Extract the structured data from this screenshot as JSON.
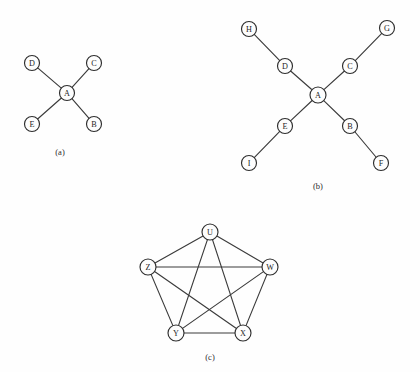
{
  "figure": {
    "background_color": "#fefefe",
    "edge_color": "#3b3b3b",
    "node_fill_color": "#fdfdfd",
    "node_stroke_color": "#2e2e2e",
    "label_color": "#1d1d1d",
    "node_radius": 7.5,
    "panels": [
      {
        "id": "a",
        "caption": "(a)",
        "caption_x": 60,
        "caption_y": 152,
        "description": "star graph with center A and four leaves",
        "nodes": [
          {
            "id": "A",
            "label": "A",
            "x": 67,
            "y": 93,
            "r": 7.5
          },
          {
            "id": "B",
            "label": "B",
            "x": 94,
            "y": 124,
            "r": 7.5
          },
          {
            "id": "C",
            "label": "C",
            "x": 94,
            "y": 63,
            "r": 7.5
          },
          {
            "id": "D",
            "label": "D",
            "x": 32,
            "y": 63,
            "r": 7.5
          },
          {
            "id": "E",
            "label": "E",
            "x": 32,
            "y": 124,
            "r": 7.5
          }
        ],
        "edges": [
          {
            "from": "A",
            "to": "B"
          },
          {
            "from": "A",
            "to": "C"
          },
          {
            "from": "A",
            "to": "D"
          },
          {
            "from": "A",
            "to": "E"
          }
        ]
      },
      {
        "id": "b",
        "caption": "(b)",
        "caption_x": 318,
        "caption_y": 186,
        "description": "tree with center A, four branches each extending to a leaf",
        "nodes": [
          {
            "id": "A",
            "label": "A",
            "x": 318,
            "y": 95,
            "r": 8.0
          },
          {
            "id": "B",
            "label": "B",
            "x": 350,
            "y": 126,
            "r": 7.5
          },
          {
            "id": "C",
            "label": "C",
            "x": 350,
            "y": 66,
            "r": 7.5
          },
          {
            "id": "D",
            "label": "D",
            "x": 285,
            "y": 66,
            "r": 7.5
          },
          {
            "id": "E",
            "label": "E",
            "x": 285,
            "y": 126,
            "r": 7.5
          },
          {
            "id": "F",
            "label": "F",
            "x": 381,
            "y": 163,
            "r": 7.5
          },
          {
            "id": "G",
            "label": "G",
            "x": 387,
            "y": 28,
            "r": 7.5
          },
          {
            "id": "H",
            "label": "H",
            "x": 249,
            "y": 29,
            "r": 7.5
          },
          {
            "id": "I",
            "label": "I",
            "x": 249,
            "y": 163,
            "r": 7.5
          }
        ],
        "edges": [
          {
            "from": "A",
            "to": "B"
          },
          {
            "from": "A",
            "to": "C"
          },
          {
            "from": "A",
            "to": "D"
          },
          {
            "from": "A",
            "to": "E"
          },
          {
            "from": "B",
            "to": "F"
          },
          {
            "from": "C",
            "to": "G"
          },
          {
            "from": "D",
            "to": "H"
          },
          {
            "from": "E",
            "to": "I"
          }
        ]
      },
      {
        "id": "c",
        "caption": "(c)",
        "caption_x": 210,
        "caption_y": 357,
        "description": "complete graph K5 drawn as a pentagon with all diagonals",
        "nodes": [
          {
            "id": "U",
            "label": "U",
            "x": 210,
            "y": 232,
            "r": 8.0
          },
          {
            "id": "W",
            "label": "W",
            "x": 270,
            "y": 267,
            "r": 8.0
          },
          {
            "id": "X",
            "label": "X",
            "x": 243,
            "y": 333,
            "r": 8.0
          },
          {
            "id": "Y",
            "label": "Y",
            "x": 176,
            "y": 333,
            "r": 8.0
          },
          {
            "id": "Z",
            "label": "Z",
            "x": 148,
            "y": 267,
            "r": 8.0
          }
        ],
        "edges": [
          {
            "from": "U",
            "to": "W"
          },
          {
            "from": "U",
            "to": "X"
          },
          {
            "from": "U",
            "to": "Y"
          },
          {
            "from": "U",
            "to": "Z"
          },
          {
            "from": "W",
            "to": "X"
          },
          {
            "from": "W",
            "to": "Y"
          },
          {
            "from": "W",
            "to": "Z"
          },
          {
            "from": "X",
            "to": "Y"
          },
          {
            "from": "X",
            "to": "Z"
          },
          {
            "from": "Y",
            "to": "Z"
          }
        ]
      }
    ]
  }
}
